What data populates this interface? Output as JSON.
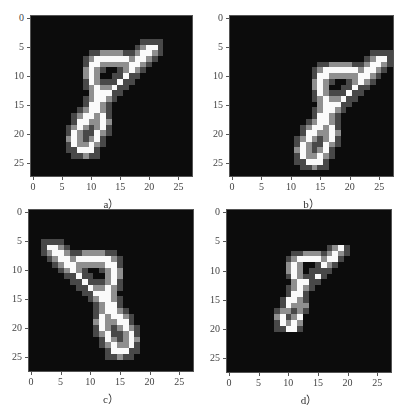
{
  "chart_data": [
    {
      "type": "heatmap",
      "id": "a",
      "caption": "a）",
      "title": "",
      "xlabel": "",
      "ylabel": "",
      "xlim": [
        -0.5,
        27.5
      ],
      "ylim": [
        27.5,
        -0.5
      ],
      "x_ticks": [
        "0",
        "5",
        "10",
        "15",
        "20",
        "25"
      ],
      "y_ticks": [
        "0",
        "5",
        "10",
        "15",
        "20",
        "25"
      ],
      "colormap": "gray",
      "description": "Original handwritten digit 8, 28x28, slanted right",
      "strokes": [
        {
          "type": "upper_loop",
          "cells": [
            [
              7,
              11
            ],
            [
              7,
              12
            ],
            [
              7,
              13
            ],
            [
              7,
              14
            ],
            [
              7,
              15
            ],
            [
              7,
              16
            ],
            [
              8,
              10
            ],
            [
              8,
              11
            ],
            [
              8,
              17
            ],
            [
              9,
              10
            ],
            [
              9,
              17
            ],
            [
              10,
              10
            ],
            [
              10,
              16
            ],
            [
              11,
              10
            ],
            [
              11,
              15
            ],
            [
              12,
              11
            ],
            [
              12,
              14
            ]
          ]
        },
        {
          "type": "tail",
          "cells": [
            [
              5,
              20
            ],
            [
              5,
              21
            ],
            [
              6,
              19
            ],
            [
              6,
              20
            ],
            [
              7,
              18
            ],
            [
              7,
              19
            ],
            [
              8,
              18
            ]
          ]
        },
        {
          "type": "waist",
          "cells": [
            [
              13,
              11
            ],
            [
              13,
              12
            ],
            [
              13,
              13
            ],
            [
              14,
              11
            ],
            [
              14,
              12
            ],
            [
              15,
              10
            ],
            [
              15,
              11
            ],
            [
              16,
              10
            ],
            [
              16,
              11
            ]
          ]
        },
        {
          "type": "lower_loop",
          "cells": [
            [
              17,
              9
            ],
            [
              17,
              10
            ],
            [
              17,
              12
            ],
            [
              18,
              8
            ],
            [
              18,
              9
            ],
            [
              18,
              12
            ],
            [
              19,
              8
            ],
            [
              19,
              12
            ],
            [
              20,
              7
            ],
            [
              20,
              11
            ],
            [
              21,
              7
            ],
            [
              21,
              11
            ],
            [
              22,
              7
            ],
            [
              22,
              10
            ],
            [
              23,
              8
            ],
            [
              23,
              9
            ],
            [
              23,
              10
            ]
          ]
        }
      ]
    },
    {
      "type": "heatmap",
      "id": "b",
      "caption": "b）",
      "xlim": [
        -0.5,
        27.5
      ],
      "ylim": [
        27.5,
        -0.5
      ],
      "x_ticks": [
        "0",
        "5",
        "10",
        "15",
        "20",
        "25"
      ],
      "y_ticks": [
        "0",
        "5",
        "10",
        "15",
        "20",
        "25"
      ],
      "colormap": "gray",
      "description": "Digit 8 translated right ~5 px and down ~2 px",
      "shift": [
        2,
        5
      ]
    },
    {
      "type": "heatmap",
      "id": "c",
      "caption": "c）",
      "xlim": [
        -0.5,
        27.5
      ],
      "ylim": [
        27.5,
        -0.5
      ],
      "x_ticks": [
        "0",
        "5",
        "10",
        "15",
        "20",
        "25"
      ],
      "y_ticks": [
        "0",
        "5",
        "10",
        "15",
        "20",
        "25"
      ],
      "colormap": "gray",
      "description": "Digit 8 mirrored/rotated so it leans left (top-left to bottom-right)",
      "transform": "flip_horizontal"
    },
    {
      "type": "heatmap",
      "id": "d",
      "caption": "d）",
      "xlim": [
        -0.5,
        27.5
      ],
      "ylim": [
        27.5,
        -0.5
      ],
      "x_ticks": [
        "0",
        "5",
        "10",
        "15",
        "20",
        "25"
      ],
      "y_ticks": [
        "0",
        "5",
        "10",
        "15",
        "20",
        "25"
      ],
      "colormap": "gray",
      "description": "Digit 8 scaled down ~0.75x",
      "scale": 0.75
    }
  ],
  "panels": [
    {
      "caption": "a）",
      "frame": {
        "left": 30,
        "top": 15,
        "width": 163,
        "height": 162
      }
    },
    {
      "caption": "b）",
      "frame": {
        "left": 229,
        "top": 15,
        "width": 165,
        "height": 162
      }
    },
    {
      "caption": "c）",
      "frame": {
        "left": 28,
        "top": 209,
        "width": 166,
        "height": 163
      }
    },
    {
      "caption": "d）",
      "frame": {
        "left": 226,
        "top": 209,
        "width": 166,
        "height": 164
      }
    }
  ],
  "ticks": [
    "0",
    "5",
    "10",
    "15",
    "20",
    "25"
  ]
}
